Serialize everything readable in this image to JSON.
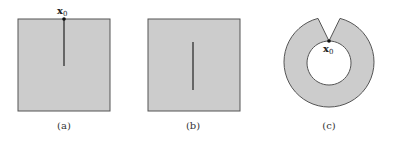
{
  "figure": {
    "panels": [
      {
        "id": "a",
        "caption": "(a)",
        "shape": "square",
        "point_label": "x",
        "point_subscript": "0",
        "crack": "from top edge to center"
      },
      {
        "id": "b",
        "caption": "(b)",
        "shape": "square",
        "crack": "interior vertical segment"
      },
      {
        "id": "c",
        "caption": "(c)",
        "shape": "annulus with notch",
        "point_label": "x",
        "point_subscript": "0",
        "crack": "wedge notch from outer to inner boundary"
      }
    ],
    "colors": {
      "fill": "#cccccc",
      "stroke": "#555555",
      "crack": "#222222",
      "background": "#ffffff"
    }
  }
}
